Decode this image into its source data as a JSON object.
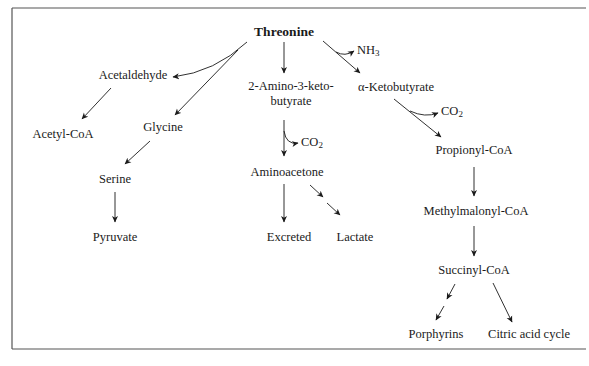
{
  "diagram": {
    "nodes": {
      "threonine": "Threonine",
      "acetaldehyde": "Acetaldehyde",
      "acetyl_coa": "Acetyl-CoA",
      "glycine": "Glycine",
      "serine": "Serine",
      "pyruvate": "Pyruvate",
      "amino_keto_line1": "2-Amino-3-keto-",
      "amino_keto_line2": "butyrate",
      "aminoacetone": "Aminoacetone",
      "excreted": "Excreted",
      "lactate": "Lactate",
      "ketobutyrate": "α-Ketobutyrate",
      "propionyl_coa": "Propionyl-CoA",
      "methylmalonyl_coa": "Methylmalonyl-CoA",
      "succinyl_coa": "Succinyl-CoA",
      "porphyrins": "Porphyrins",
      "citric_acid_cycle": "Citric acid cycle"
    },
    "byproducts": {
      "nh3_base": "NH",
      "nh3_sub": "3",
      "co2_a_base": "CO",
      "co2_a_sub": "2",
      "co2_b_base": "CO",
      "co2_b_sub": "2"
    },
    "colors": {
      "ink": "#1a1a1a",
      "frame": "#555555",
      "background": "#ffffff"
    }
  }
}
